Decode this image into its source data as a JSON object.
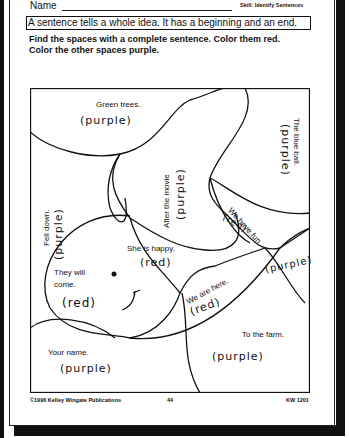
{
  "header": {
    "name_label": "Name",
    "skill": "Skill: Identify Sentences"
  },
  "rule": "A sentence tells a whole idea.  It has a beginning and an end.",
  "instructions": {
    "line1": "Find the spaces with a complete sentence.  Color them red.",
    "line2": "Color the other spaces purple."
  },
  "regions": [
    {
      "text": "Green trees.",
      "answer": "(purple)"
    },
    {
      "text": "Fell down.",
      "answer": "(purple)"
    },
    {
      "text": "After the movie",
      "answer": "(purple)"
    },
    {
      "text": "The blue ball.",
      "answer": "(purple)"
    },
    {
      "text": "We have fun",
      "answer": "(red)"
    },
    {
      "text": "She is happy.",
      "answer": "(red)"
    },
    {
      "text": "They will come.",
      "answer": "(red)"
    },
    {
      "text": "We are here.",
      "answer": "(red)"
    },
    {
      "text": "",
      "answer": "(purple)"
    },
    {
      "text": "To the farm.",
      "answer": "(purple)"
    },
    {
      "text": "Your name.",
      "answer": "(purple)"
    }
  ],
  "they_will_line1": "They will",
  "they_will_line2": "come.",
  "footer": {
    "copyright": "©1996 Kelley Wingate Publications",
    "page_number": "44",
    "code": "KW 1201"
  }
}
